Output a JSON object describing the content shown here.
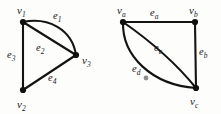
{
  "figure": {
    "background_color": "#fdfdfc",
    "ink_color": "#131313",
    "graphs": [
      {
        "id": "left-graph",
        "name": "graph-1",
        "vertices": [
          {
            "id": "v1",
            "label": "v",
            "sub": "1",
            "x": 23,
            "y": 22,
            "label_x": 17,
            "label_y": 14
          },
          {
            "id": "v2",
            "label": "v",
            "sub": "2",
            "x": 23,
            "y": 90,
            "label_x": 17,
            "label_y": 108
          },
          {
            "id": "v3",
            "label": "v",
            "sub": "3",
            "x": 76,
            "y": 55,
            "label_x": 82,
            "label_y": 64
          }
        ],
        "edges": [
          {
            "id": "e1",
            "label": "e",
            "sub": "1",
            "from": "v1",
            "to": "v3",
            "shape": "curve",
            "label_x": 53,
            "label_y": 19
          },
          {
            "id": "e2",
            "label": "e",
            "sub": "2",
            "from": "v1",
            "to": "v3",
            "shape": "straight",
            "label_x": 36,
            "label_y": 51
          },
          {
            "id": "e3",
            "label": "e",
            "sub": "3",
            "from": "v1",
            "to": "v2",
            "shape": "straight",
            "label_x": 7,
            "label_y": 58
          },
          {
            "id": "e4",
            "label": "e",
            "sub": "4",
            "from": "v2",
            "to": "v3",
            "shape": "straight",
            "label_x": 48,
            "label_y": 81
          }
        ]
      },
      {
        "id": "right-graph",
        "name": "graph-2",
        "vertices": [
          {
            "id": "va",
            "label": "v",
            "sub": "a",
            "x": 123,
            "y": 22,
            "label_x": 117,
            "label_y": 14
          },
          {
            "id": "vb",
            "label": "v",
            "sub": "b",
            "x": 195,
            "y": 22,
            "label_x": 189,
            "label_y": 14
          },
          {
            "id": "vc",
            "label": "v",
            "sub": "c",
            "x": 196,
            "y": 88,
            "label_x": 190,
            "label_y": 105
          }
        ],
        "edges": [
          {
            "id": "ea",
            "label": "e",
            "sub": "a",
            "from": "va",
            "to": "vb",
            "shape": "straight",
            "label_x": 150,
            "label_y": 16
          },
          {
            "id": "eb",
            "label": "e",
            "sub": "b",
            "from": "vb",
            "to": "vc",
            "shape": "straight",
            "label_x": 199,
            "label_y": 55
          },
          {
            "id": "ec",
            "label": "e",
            "sub": "c",
            "from": "va",
            "to": "vc",
            "shape": "curve-inner",
            "label_x": 154,
            "label_y": 51
          },
          {
            "id": "ed",
            "label": "e",
            "sub": "d",
            "from": "va",
            "to": "vc",
            "shape": "curve-outer",
            "label_x": 132,
            "label_y": 72
          }
        ],
        "speck": {
          "x": 146,
          "y": 78,
          "r": 2.4
        }
      }
    ]
  }
}
